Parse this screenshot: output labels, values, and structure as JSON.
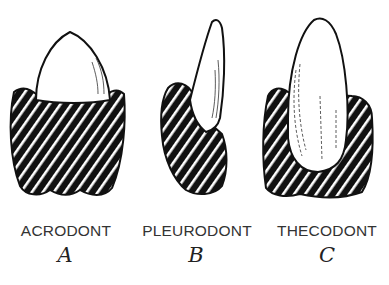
{
  "figure": {
    "types": [
      {
        "name": "ACRODONT",
        "letter": "A"
      },
      {
        "name": "PLEURODONT",
        "letter": "B"
      },
      {
        "name": "THECODONT",
        "letter": "C"
      }
    ],
    "colors": {
      "ink": "#111111",
      "background": "#ffffff",
      "label": "#333333"
    }
  }
}
